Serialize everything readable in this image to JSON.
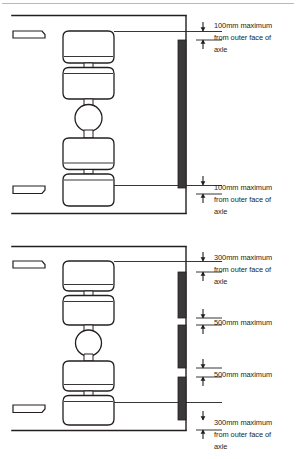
{
  "document": {
    "title": "Spray suppression / mudguard clearance limits — twin-axle wheel assembly",
    "type": "technical-diagram",
    "colors": {
      "line": "#231f20",
      "fill_dark": "#3a3a3a",
      "page_rule": "#b8b8b8",
      "background": "#ffffff"
    }
  },
  "figures": [
    {
      "id": "figure-top",
      "name": "100mm maximum clearance configuration",
      "valance_style": "continuous",
      "labels": [
        {
          "id": "top-upper-label",
          "lines": [
            "100mm maximum",
            "from outer face of",
            "axle"
          ],
          "value": "100mm",
          "qualifier": "maximum",
          "reference": "from outer face of axle"
        },
        {
          "id": "top-lower-label",
          "lines": [
            "100mm maximum",
            "from outer face of",
            "axle"
          ],
          "value": "100mm",
          "qualifier": "maximum",
          "reference": "from outer face of axle"
        }
      ]
    },
    {
      "id": "figure-bottom",
      "name": "300mm / 500mm maximum clearance configuration",
      "valance_style": "segmented",
      "labels": [
        {
          "id": "bottom-label-1",
          "lines": [
            "300mm maximum",
            "from outer face of",
            "axle"
          ],
          "value": "300mm",
          "qualifier": "maximum",
          "reference": "from outer face of axle"
        },
        {
          "id": "bottom-label-2",
          "lines": [
            "500mm maximum"
          ],
          "value": "500mm",
          "qualifier": "maximum",
          "reference": ""
        },
        {
          "id": "bottom-label-3",
          "lines": [
            "500mm maximum"
          ],
          "value": "500mm",
          "qualifier": "maximum",
          "reference": ""
        },
        {
          "id": "bottom-label-4",
          "lines": [
            "300mm maximum",
            "from outer face of",
            "axle"
          ],
          "value": "300mm",
          "qualifier": "maximum",
          "reference": "from outer face of axle"
        }
      ]
    }
  ],
  "text": {
    "t100_l1": "100mm maximum",
    "t100_l2": "from outer face of",
    "t100_l3": "axle",
    "t300_l1": "300mm maximum",
    "t300_l2": "from outer face of",
    "t300_l3": "axle",
    "t500": "500mm maximum"
  }
}
